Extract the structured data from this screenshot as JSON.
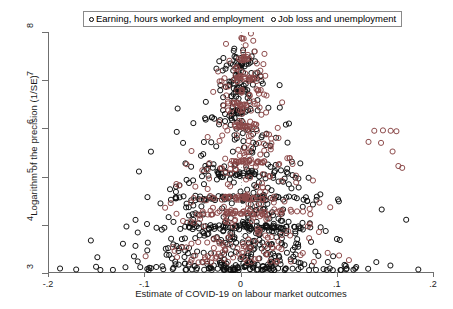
{
  "chart_data": {
    "type": "scatter",
    "title": "",
    "xlabel": "Estimate of COVID-19 on labour market outcomes",
    "ylabel": "Logarithm of the precision (1/SE)",
    "xlim": [
      -0.2,
      0.2
    ],
    "ylim": [
      3,
      8
    ],
    "xticks": [
      -0.2,
      -0.1,
      0,
      0.1,
      0.2
    ],
    "xticklabels": [
      "-.2",
      "-.1",
      "0",
      ".1",
      ".2"
    ],
    "yticks": [
      3,
      4,
      5,
      6,
      7,
      8
    ],
    "yticklabels": [
      "3",
      "4",
      "5",
      "6",
      "7",
      "8"
    ],
    "grid": false,
    "zero_reference_line": 0,
    "marker": {
      "shape": "circle",
      "filled": false,
      "size_px": 5,
      "stroke_px": 1
    },
    "legend": {
      "position": "top-center",
      "boxed": true,
      "entries": [
        {
          "label": "Earning, hours worked  and employment",
          "color": "#111111",
          "marker": "open-circle"
        },
        {
          "label": "Job loss and unemployment",
          "color": "#8c4a4a",
          "marker": "open-circle"
        }
      ]
    },
    "series": [
      {
        "name": "Earning, hours worked  and employment",
        "color": "#111111",
        "n_points": 560,
        "distribution": {
          "kind": "funnel",
          "center": 0.0,
          "spread_at_ymin": 0.105,
          "spread_at_ymax": 0.01,
          "y_weighting": "low-heavy",
          "bands": [
            {
              "y": 3.95,
              "dy": 0.05,
              "n": 70,
              "xspread": 0.085
            },
            {
              "y": 4.55,
              "dy": 0.05,
              "n": 55,
              "xspread": 0.07
            },
            {
              "y": 5.05,
              "dy": 0.05,
              "n": 30,
              "xspread": 0.045
            },
            {
              "y": 6.35,
              "dy": 0.04,
              "n": 16,
              "xspread": 0.014
            },
            {
              "y": 6.8,
              "dy": 0.04,
              "n": 12,
              "xspread": 0.01
            },
            {
              "y": 7.3,
              "dy": 0.04,
              "n": 10,
              "xspread": 0.008
            }
          ]
        }
      },
      {
        "name": "Job loss and unemployment",
        "color": "#8c4a4a",
        "n_points": 300,
        "distribution": {
          "kind": "funnel",
          "center": 0.004,
          "spread_at_ymin": 0.075,
          "spread_at_ymax": 0.01,
          "y_weighting": "mid-heavy",
          "bands": [
            {
              "y": 4.25,
              "dy": 0.045,
              "n": 45,
              "xspread": 0.04
            },
            {
              "y": 4.55,
              "dy": 0.045,
              "n": 38,
              "xspread": 0.035
            },
            {
              "y": 5.3,
              "dy": 0.04,
              "n": 22,
              "xspread": 0.025
            },
            {
              "y": 6.05,
              "dy": 0.04,
              "n": 18,
              "xspread": 0.016
            },
            {
              "y": 6.5,
              "dy": 0.04,
              "n": 16,
              "xspread": 0.013
            },
            {
              "y": 7.05,
              "dy": 0.04,
              "n": 14,
              "xspread": 0.01
            },
            {
              "y": 7.45,
              "dy": 0.04,
              "n": 12,
              "xspread": 0.008
            }
          ],
          "outliers": [
            {
              "x": 0.139,
              "y": 5.95
            },
            {
              "x": 0.148,
              "y": 5.96
            },
            {
              "x": 0.156,
              "y": 5.95
            },
            {
              "x": 0.162,
              "y": 5.94
            },
            {
              "x": 0.133,
              "y": 5.72
            },
            {
              "x": 0.146,
              "y": 5.7
            },
            {
              "x": 0.158,
              "y": 5.52
            },
            {
              "x": 0.164,
              "y": 5.22
            },
            {
              "x": 0.168,
              "y": 5.18
            }
          ]
        }
      }
    ]
  }
}
